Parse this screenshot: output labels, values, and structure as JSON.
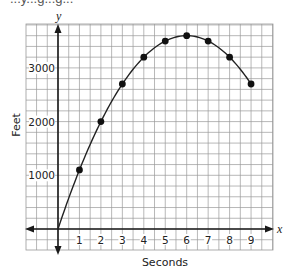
{
  "header": {
    "title_partial": "...y...g...g..."
  },
  "chart_data": {
    "type": "scatter",
    "subtype": "line-with-markers",
    "title": "",
    "xlabel": "Seconds",
    "ylabel": "Feet",
    "x_axis_letter": "x",
    "y_axis_letter": "y",
    "x": [
      0,
      1,
      2,
      3,
      4,
      5,
      6,
      7,
      8,
      9
    ],
    "series": [
      {
        "name": "height",
        "values": [
          0,
          1100,
          2000,
          2700,
          3200,
          3500,
          3600,
          3500,
          3200,
          2700
        ],
        "markers_at": [
          1,
          2,
          3,
          4,
          5,
          6,
          7,
          8,
          9
        ]
      }
    ],
    "x_ticks": [
      "1",
      "2",
      "3",
      "4",
      "5",
      "6",
      "7",
      "8",
      "9"
    ],
    "y_ticks": [
      "1000",
      "2000",
      "3000"
    ],
    "xlim": [
      -1.5,
      10
    ],
    "ylim": [
      -400,
      3800
    ],
    "grid": {
      "on": true,
      "x_step": 0.5,
      "y_step": 200
    },
    "legend": null,
    "colors": {
      "grid": "#9a9a9a",
      "axis": "#1a1a1a",
      "curve": "#222222",
      "marker": "#111111"
    }
  }
}
